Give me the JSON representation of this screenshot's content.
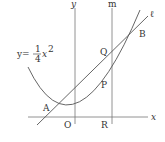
{
  "diagram": {
    "axes": {
      "x_label": "x",
      "y_label": "y",
      "origin_label": "O"
    },
    "curve": {
      "equation_lhs": "y=",
      "coef_num": "1",
      "coef_den": "4",
      "var": "x",
      "exp": "2"
    },
    "lines": {
      "l_label": "ℓ",
      "m_label": "m"
    },
    "points": {
      "A": "A",
      "B": "B",
      "P": "P",
      "Q": "Q",
      "R": "R"
    },
    "colors": {
      "stroke": "#555555",
      "axis": "#777777",
      "text": "#333333"
    }
  }
}
